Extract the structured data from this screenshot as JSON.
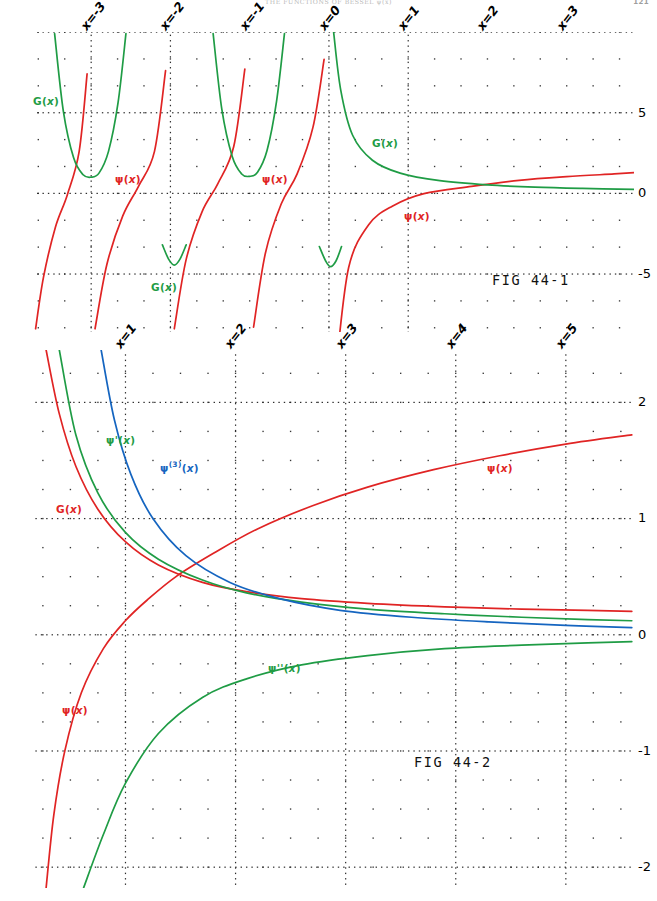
{
  "page": {
    "running_head": "THE FUNCTIONS OF BESSEL ψ(x)",
    "folio": "121",
    "width": 657,
    "height": 901,
    "background": "#ffffff"
  },
  "colors": {
    "psi": "#e02424",
    "green": "#1f9c45",
    "blue": "#1565c0",
    "dark": "#231f20",
    "grid": "#1a1a1a"
  },
  "figures": [
    {
      "id": "fig-44-1",
      "caption": "FIG 44-1",
      "caption_x": 492,
      "caption_y": 272,
      "plot": {
        "left": 34,
        "top": 32,
        "width": 600,
        "height": 300
      },
      "x_axis": {
        "label_prefix": "x=",
        "ticks": [
          -3,
          -2,
          -1,
          0,
          1,
          2,
          3
        ],
        "tick_labels": [
          "x=-3",
          "x=-2",
          "x=-1",
          "x=0",
          "x=1",
          "x=2",
          "x=3"
        ],
        "min": -3.72,
        "max": 3.85,
        "minor_per_major": 2
      },
      "y_axis": {
        "ticks": [
          5,
          0,
          -5
        ],
        "tick_labels": [
          "5",
          "0",
          "-5"
        ],
        "min": -8.6,
        "max": 10.0,
        "minor_per_major": 2
      },
      "series": [
        {
          "name": "ψ(x)",
          "color": "#e02424",
          "label_html": "ψ(<i>x</i>)"
        },
        {
          "name": "G(x)",
          "color": "#1f9c45",
          "label_html": "G(<i>x</i>)"
        }
      ],
      "annotations": [
        {
          "text": "G(<i>x</i>)",
          "color": "green",
          "x": 33,
          "y": 95
        },
        {
          "text": "ψ(<i>x</i>)",
          "color": "red",
          "x": 115,
          "y": 173
        },
        {
          "text": "ψ(<i>x</i>)",
          "color": "red",
          "x": 262,
          "y": 173
        },
        {
          "text": "G(<i>x</i>)",
          "color": "green",
          "x": 151,
          "y": 281
        },
        {
          "text": "G(<i>x</i>)",
          "color": "green",
          "x": 372,
          "y": 137
        },
        {
          "text": "ψ(<i>x</i>)",
          "color": "red",
          "x": 404,
          "y": 210
        }
      ]
    },
    {
      "id": "fig-44-2",
      "caption": "FIG 44-2",
      "caption_x": 414,
      "caption_y": 754,
      "plot": {
        "left": 34,
        "top": 350,
        "width": 600,
        "height": 538
      },
      "x_axis": {
        "label_prefix": "x=",
        "ticks": [
          1,
          2,
          3,
          4,
          5
        ],
        "tick_labels": [
          "x=1",
          "x=2",
          "x=3",
          "x=4",
          "x=5"
        ],
        "min": 0.17,
        "max": 5.62,
        "minor_per_major": 3
      },
      "y_axis": {
        "ticks": [
          2,
          1,
          0,
          -1,
          -2
        ],
        "tick_labels": [
          "2",
          "1",
          "0",
          "-1",
          "-2"
        ],
        "min": -2.18,
        "max": 2.45,
        "minor_per_major": 3
      },
      "series": [
        {
          "name": "ψ(x)",
          "color": "#e02424",
          "label_html": "ψ(<i>x</i>)"
        },
        {
          "name": "G(x)",
          "color": "#e02424",
          "label_html": "G(<i>x</i>)"
        },
        {
          "name": "ψ'(x)",
          "color": "#1f9c45",
          "label_html": "ψ'(<i>x</i>)"
        },
        {
          "name": "ψ''(x)",
          "color": "#1f9c45",
          "label_html": "ψ''(<i>x</i>)"
        },
        {
          "name": "ψ(3)(x)",
          "color": "#1565c0",
          "label_html": "ψ<sup>(3)</sup>(<i>x</i>)"
        }
      ],
      "annotations": [
        {
          "text": "ψ'(<i>x</i>)",
          "color": "green",
          "x": 106,
          "y": 434
        },
        {
          "text": "ψ<sup>(3)</sup>(<i>x</i>)",
          "color": "blue",
          "x": 160,
          "y": 460
        },
        {
          "text": "G(<i>x</i>)",
          "color": "red",
          "x": 56,
          "y": 503
        },
        {
          "text": "ψ(<i>x</i>)",
          "color": "red",
          "x": 487,
          "y": 462
        },
        {
          "text": "ψ''(<i>x</i>)",
          "color": "green",
          "x": 268,
          "y": 662
        },
        {
          "text": "ψ(<i>x</i>)",
          "color": "red",
          "x": 62,
          "y": 704
        }
      ]
    }
  ],
  "chart_data": [
    {
      "type": "line",
      "title": "FIG 44-1",
      "xlabel": "x",
      "ylabel": "",
      "xlim": [
        -3.72,
        3.85
      ],
      "ylim": [
        -8.6,
        10.0
      ],
      "xticks": [
        -3,
        -2,
        -1,
        0,
        1,
        2,
        3
      ],
      "yticks": [
        5,
        0,
        -5
      ],
      "grid": true,
      "legend": "inline-annotations",
      "description": "Digamma function psi(x) with poles at non-positive integers, and G(x) = psi(x)+psi(1-x) style companion; psi in red has a branch in each interval between consecutive poles, G in green shows U shaped minima above the poles for x<0 and a monotone decreasing branch for x>0.",
      "series": [
        {
          "name": "psi(x)",
          "color": "#e02424",
          "poles": [
            -3,
            -2,
            -1,
            0
          ],
          "branches": [
            {
              "x": [
                -3.7,
                -3.6,
                -3.45,
                -3.3,
                -3.15,
                -3.05
              ],
              "y": [
                -8.4,
                -5.2,
                -2.1,
                -0.1,
                2.6,
                7.4
              ]
            },
            {
              "x": [
                -2.95,
                -2.8,
                -2.6,
                -2.4,
                -2.2,
                -2.06
              ],
              "y": [
                -8.4,
                -4.4,
                -1.4,
                0.45,
                2.6,
                7.6
              ]
            },
            {
              "x": [
                -1.95,
                -1.8,
                -1.6,
                -1.4,
                -1.2,
                -1.06
              ],
              "y": [
                -8.4,
                -4.1,
                -1.15,
                0.6,
                2.9,
                7.7
              ]
            },
            {
              "x": [
                -0.95,
                -0.8,
                -0.6,
                -0.4,
                -0.2,
                -0.06
              ],
              "y": [
                -8.3,
                -3.7,
                -0.65,
                1.2,
                4.1,
                8.3
              ]
            },
            {
              "x": [
                0.1,
                0.25,
                0.5,
                0.8,
                1.2,
                1.8,
                2.4,
                3.0,
                3.6,
                3.85
              ],
              "y": [
                -10.4,
                -4.6,
                -1.96,
                -0.8,
                -0.02,
                0.43,
                0.8,
                1.03,
                1.2,
                1.28
              ]
            }
          ]
        },
        {
          "name": "G(x)",
          "color": "#1f9c45",
          "branches": [
            {
              "x": [
                -3.46,
                -3.35,
                -3.22,
                -3.1,
                -3.0,
                -2.9,
                -2.78,
                -2.66,
                -2.56
              ],
              "y": [
                9.9,
                5.1,
                2.2,
                1.15,
                1.0,
                1.25,
                2.6,
                5.6,
                9.9
              ]
            },
            {
              "x": [
                -2.1,
                -2.02,
                -1.95,
                -1.88,
                -1.8
              ],
              "y": [
                -3.2,
                -4.1,
                -4.45,
                -4.1,
                -3.2
              ]
            },
            {
              "x": [
                -1.46,
                -1.35,
                -1.22,
                -1.1,
                -1.0,
                -0.9,
                -0.78,
                -0.66,
                -0.56
              ],
              "y": [
                9.9,
                5.2,
                2.3,
                1.2,
                1.05,
                1.3,
                2.65,
                5.7,
                9.9
              ]
            },
            {
              "x": [
                -0.12,
                -0.04,
                0.02,
                0.09,
                0.16
              ],
              "y": [
                -3.3,
                -4.2,
                -4.55,
                -4.2,
                -3.3
              ]
            },
            {
              "x": [
                0.06,
                0.15,
                0.3,
                0.55,
                0.9,
                1.4,
                2.0,
                2.6,
                3.2,
                3.85
              ],
              "y": [
                10.0,
                6.4,
                3.6,
                2.05,
                1.25,
                0.78,
                0.52,
                0.38,
                0.3,
                0.24
              ]
            }
          ]
        }
      ]
    },
    {
      "type": "line",
      "title": "FIG 44-2",
      "xlabel": "x",
      "ylabel": "",
      "xlim": [
        0.17,
        5.62
      ],
      "ylim": [
        -2.18,
        2.45
      ],
      "xticks": [
        1,
        2,
        3,
        4,
        5
      ],
      "yticks": [
        2,
        1,
        0,
        -1,
        -2
      ],
      "grid": true,
      "legend": "inline-annotations",
      "description": "Digamma psi(x) increasing through zero near x=1.46, its derivatives psi'(x) (green, decreasing to 0), psi''(x) (green, negative increasing to 0), psi(3)(x) (blue, decreasing to 0) and G(x) (red, decreasing) on the positive axis.",
      "series": [
        {
          "name": "psi(x)",
          "color": "#e02424",
          "x": [
            0.28,
            0.35,
            0.45,
            0.6,
            0.8,
            1.0,
            1.2,
            1.46,
            1.8,
            2.2,
            2.7,
            3.2,
            3.8,
            4.4,
            5.0,
            5.6
          ],
          "y": [
            -2.18,
            -1.55,
            -1.0,
            -0.5,
            -0.12,
            0.12,
            0.3,
            0.5,
            0.7,
            0.91,
            1.11,
            1.27,
            1.42,
            1.54,
            1.64,
            1.72
          ]
        },
        {
          "name": "G(x)",
          "color": "#e02424",
          "x": [
            0.28,
            0.4,
            0.55,
            0.75,
            1.0,
            1.3,
            1.7,
            2.1,
            2.6,
            3.2,
            3.9,
            4.6,
            5.2,
            5.6
          ],
          "y": [
            2.45,
            1.9,
            1.45,
            1.08,
            0.8,
            0.6,
            0.45,
            0.37,
            0.31,
            0.27,
            0.24,
            0.22,
            0.21,
            0.2
          ]
        },
        {
          "name": "psi'(x)",
          "color": "#1f9c45",
          "x": [
            0.4,
            0.55,
            0.75,
            1.0,
            1.3,
            1.7,
            2.1,
            2.6,
            3.2,
            3.9,
            4.6,
            5.2,
            5.6
          ],
          "y": [
            2.45,
            1.72,
            1.22,
            0.88,
            0.65,
            0.47,
            0.36,
            0.28,
            0.22,
            0.18,
            0.15,
            0.13,
            0.12
          ]
        },
        {
          "name": "psi''(x)",
          "color": "#1f9c45",
          "x": [
            0.62,
            0.8,
            1.0,
            1.3,
            1.7,
            2.1,
            2.6,
            3.2,
            3.9,
            4.6,
            5.2,
            5.6
          ],
          "y": [
            -2.18,
            -1.72,
            -1.28,
            -0.85,
            -0.54,
            -0.38,
            -0.26,
            -0.18,
            -0.12,
            -0.09,
            -0.07,
            -0.06
          ]
        },
        {
          "name": "psi(3)(x)",
          "color": "#1565c0",
          "x": [
            0.78,
            0.9,
            1.05,
            1.25,
            1.55,
            1.95,
            2.4,
            2.95,
            3.6,
            4.3,
            5.0,
            5.6
          ],
          "y": [
            2.45,
            1.85,
            1.38,
            1.0,
            0.68,
            0.45,
            0.31,
            0.21,
            0.15,
            0.11,
            0.08,
            0.06
          ]
        }
      ]
    }
  ]
}
